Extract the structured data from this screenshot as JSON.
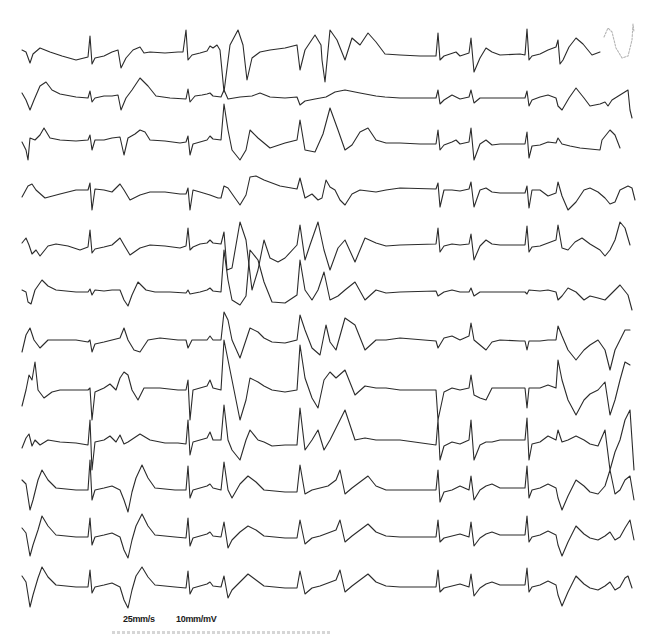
{
  "calibration": {
    "paper_speed": "25mm/s",
    "gain": "10mm/mV"
  },
  "footer_text": "",
  "colors": {
    "trace": "#2b2b2b",
    "faded_trace": "#b5b5b5",
    "background": "#ffffff"
  },
  "leads": [
    {
      "index": 1,
      "baseline_y": 57,
      "d": "M22,50 L26,52 L30,63 L33,54 L40,48 L50,52 L62,56 L76,60 L88,57 L90,36 L92,64 L95,58 L104,56 L112,52 L118,50 L121,68 L126,58 L133,50 L140,47 L144,53 L150,52 L165,53 L178,52 L183,52 L186,30 L188,60 L192,55 L200,53 L207,51 L210,46 L213,48 L217,45 L220,50 L224,92 L230,45 L238,30 L243,45 L247,80 L252,58 L260,52 L270,50 L285,48 L297,45 L300,70 L305,50 L315,35 L321,45 L322,60 L325,82 L330,30 L337,40 L345,60 L352,38 L360,45 L368,33 L376,42 L385,54 L400,55 L420,56 L436,56 L438,33 L440,60 L444,56 L456,52 L460,56 L469,53 L471,38 L474,72 L480,58 L486,48 L492,52 L500,55 L520,54 L525,55 L527,29 L529,60 L532,56 L540,54 L548,50 L556,47 L558,40 L560,64 L563,60 L569,47 L576,38 L583,44 L592,55 L600,52"
    },
    {
      "index": 2,
      "baseline_y": 98,
      "d": "M22,93 L26,100 L30,110 L34,100 L40,86 L46,82 L52,90 L60,94 L76,97 L88,98 L90,91 L92,102 L95,98 L104,96 L112,96 L118,95 L121,110 L126,98 L132,90 L140,78 L148,86 L156,96 L170,98 L186,99 L188,89 L190,102 L195,96 L202,95 L207,94 L210,93 L213,96 L221,97 L224,90 L228,99 L240,97 L252,96 L260,93 L270,97 L285,98 L297,97 L300,105 L305,101 L315,99 L326,97 L335,92 L345,90 L360,93 L376,96 L385,97 L400,98 L420,98 L436,98 L438,90 L440,104 L444,100 L452,95 L460,99 L469,97 L471,90 L474,103 L480,98 L492,98 L500,98 L520,98 L525,98 L527,91 L529,106 L532,100 L540,97 L548,95 L556,98 L558,106 L562,110 L569,98 L576,88 L584,98 L590,106 L600,104 L605,102 L608,106 L612,100 L620,95 L628,90 L630,110 L632,118"
    },
    {
      "index": 3,
      "baseline_y": 141,
      "d": "M22,142 L26,150 L28,160 L30,138 L35,140 L40,135 L44,128 L50,138 L60,140 L76,141 L88,140 L90,135 L92,150 L95,140 L104,140 L112,138 L120,137 L124,155 L128,138 L135,134 L140,130 L145,132 L150,140 L165,141 L180,143 L186,142 L188,136 L190,155 L193,144 L200,142 L207,140 L210,136 L213,139 L221,140 L224,104 L228,130 L232,150 L240,160 L246,150 L250,130 L258,138 L270,148 L285,143 L297,140 L300,120 L305,150 L315,152 L323,134 L330,108 L338,130 L345,150 L352,145 L360,132 L368,128 L376,140 L386,143 L400,143 L420,144 L436,144 L438,130 L440,150 L444,145 L452,142 L456,140 L460,144 L469,142 L471,128 L474,160 L480,144 L486,140 L492,145 L500,144 L520,144 L525,144 L527,132 L529,158 L532,146 L540,145 L548,142 L556,143 L558,138 L562,144 L570,146 L580,148 L600,150 L602,140 L606,135 L610,130 L615,135 L620,148"
    },
    {
      "index": 4,
      "baseline_y": 187,
      "d": "M22,197 L28,186 L32,184 L36,190 L45,198 L60,194 L76,190 L88,190 L90,183 L92,210 L95,189 L104,190 L112,192 L120,184 L124,190 L130,200 L140,195 L150,192 L165,192 L180,194 L186,194 L188,188 L190,210 L193,190 L200,192 L210,195 L218,198 L221,198 L224,186 L228,188 L235,198 L240,205 L246,195 L250,177 L256,176 L264,180 L280,186 L297,189 L300,178 L305,198 L312,194 L318,200 L322,198 L326,180 L330,187 L335,190 L340,200 L345,205 L352,194 L360,190 L376,192 L386,190 L400,188 L436,189 L438,183 L440,207 L444,190 L452,190 L460,191 L469,189 L471,182 L474,207 L480,190 L486,188 L492,192 L500,193 L520,193 L525,193 L527,186 L529,208 L532,190 L540,190 L548,196 L556,193 L558,182 L562,196 L568,210 L576,202 L584,190 L590,188 L598,192 L605,198 L610,204 L615,202 L620,190 L628,186 L632,188 L635,200"
    },
    {
      "index": 5,
      "baseline_y": 243,
      "d": "M22,243 L26,238 L29,245 L32,254 L36,250 L40,256 L48,246 L56,244 L68,246 L80,250 L88,247 L90,230 L92,253 L95,249 L104,247 L112,245 L120,238 L124,245 L130,255 L140,248 L150,245 L165,246 L180,248 L186,246 L188,228 L190,250 L193,247 L200,244 L207,243 L210,240 L213,243 L221,244 L224,232 L227,270 L232,268 L240,222 L246,240 L252,290 L258,270 L264,240 L270,258 L278,262 L285,258 L297,245 L300,225 L305,260 L310,245 L318,222 L324,250 L330,270 L338,248 L345,240 L355,262 L365,238 L376,243 L386,246 L400,245 L436,244 L438,228 L440,252 L444,246 L452,244 L460,245 L469,244 L471,234 L474,260 L480,246 L486,240 L492,244 L500,245 L520,245 L525,245 L527,226 L529,252 L532,247 L540,246 L548,243 L556,240 L558,225 L562,248 L568,250 L575,242 L582,238 L590,244 L600,250 L605,256 L610,250 L615,240 L620,222 L625,228 L630,245"
    },
    {
      "index": 6,
      "baseline_y": 291,
      "d": "M22,290 L26,292 L28,302 L31,304 L35,290 L42,280 L48,286 L56,290 L76,292 L88,292 L90,289 L92,295 L95,290 L104,291 L112,290 L120,290 L124,300 L128,306 L132,295 L138,282 L146,290 L155,292 L170,292 L186,293 L188,290 L190,294 L200,292 L207,290 L210,288 L213,291 L221,292 L224,250 L228,280 L232,300 L240,305 L246,296 L250,250 L258,260 L264,282 L272,302 L285,303 L297,295 L300,260 L305,290 L312,300 L318,290 L324,272 L330,300 L338,296 L345,290 L355,282 L365,300 L376,290 L386,293 L400,292 L436,291 L438,296 L444,292 L452,290 L460,292 L469,292 L471,288 L474,296 L480,292 L492,292 L500,292 L520,292 L525,292 L527,294 L529,290 L540,291 L548,290 L556,292 L558,300 L562,296 L568,288 L576,292 L584,300 L590,296 L598,298 L605,300 L610,295 L615,290 L620,285 L628,295 L632,310"
    },
    {
      "index": 7,
      "baseline_y": 340,
      "d": "M22,352 L26,335 L30,328 L34,340 L40,348 L48,340 L60,340 L76,340 L88,342 L90,340 L92,352 L95,344 L104,342 L112,340 L120,338 L124,328 L128,340 L134,350 L140,352 L148,340 L160,338 L178,340 L186,340 L188,348 L192,340 L200,340 L207,340 L210,336 L213,340 L221,340 L224,312 L228,320 L232,340 L240,358 L246,340 L250,328 L258,332 L264,338 L272,342 L285,343 L297,340 L300,315 L305,330 L312,348 L320,355 L326,325 L330,342 L336,350 L345,318 L355,325 L365,350 L376,340 L386,340 L400,338 L436,341 L438,348 L444,338 L452,336 L460,340 L469,336 L471,323 L474,340 L480,345 L486,350 L492,342 L500,340 L520,341 L525,341 L527,350 L529,341 L540,341 L548,340 L556,340 L558,326 L562,336 L568,350 L576,360 L584,350 L590,345 L598,340 L605,350 L610,370 L615,350 L620,340 L625,330 L630,330"
    },
    {
      "index": 8,
      "baseline_y": 390,
      "d": "M22,406 L26,390 L29,375 L32,380 L35,362 L38,390 L44,398 L52,392 L60,390 L76,390 L88,390 L90,388 L92,420 L95,392 L104,388 L110,384 L116,390 L120,378 L124,372 L128,375 L132,390 L138,400 L144,388 L160,388 L178,390 L186,390 L188,380 L190,420 L193,390 L200,388 L207,386 L210,380 L213,388 L221,390 L224,340 L228,360 L232,380 L240,420 L246,400 L250,378 L258,382 L264,386 L272,390 L285,392 L297,390 L300,345 L305,378 L312,398 L318,408 L324,380 L330,372 L336,378 L345,370 L355,395 L365,386 L376,388 L386,388 L400,390 L436,390 L438,420 L444,392 L452,388 L460,390 L469,388 L471,375 L474,395 L480,398 L486,400 L492,388 L500,388 L520,388 L525,388 L527,408 L529,388 L540,388 L548,385 L556,388 L558,360 L562,380 L568,400 L576,415 L584,400 L590,394 L598,390 L605,382 L610,415 L615,400 L620,380 L625,362 L630,365"
    },
    {
      "index": 9,
      "baseline_y": 441,
      "d": "M22,448 L26,438 L29,434 L32,446 L35,440 L40,445 L48,440 L60,442 L76,443 L88,445 L90,420 L92,470 L95,442 L104,440 L110,436 L116,442 L120,435 L124,444 L128,442 L140,434 L150,440 L165,443 L178,443 L186,444 L188,420 L190,455 L193,442 L200,440 L207,438 L210,432 L213,440 L221,440 L224,405 L228,440 L232,450 L240,460 L246,440 L250,430 L258,440 L264,442 L272,446 L285,445 L297,445 L300,408 L305,450 L312,440 L318,430 L324,450 L330,440 L336,428 L345,410 L355,440 L365,438 L376,440 L386,440 L400,440 L436,445 L438,420 L440,460 L444,446 L452,442 L460,444 L469,440 L471,420 L474,460 L480,445 L486,442 L492,442 L500,440 L520,440 L525,440 L527,418 L529,460 L532,444 L540,442 L548,436 L556,440 L558,430 L562,442 L568,440 L576,436 L584,440 L590,444 L598,446 L605,430 L610,470 L615,452 L620,440 L625,420 L630,410 L634,470"
    },
    {
      "index": 10,
      "baseline_y": 490,
      "d": "M22,480 L26,484 L30,510 L33,500 L38,480 L42,470 L48,480 L56,488 L76,490 L88,490 L90,460 L92,500 L95,490 L104,488 L112,486 L120,490 L124,500 L128,512 L132,492 L136,478 L142,465 L148,478 L155,488 L175,490 L186,490 L188,466 L190,498 L193,490 L200,488 L207,486 L210,484 L213,488 L221,490 L224,462 L228,490 L232,498 L240,484 L248,476 L256,482 L264,490 L285,492 L297,492 L300,465 L305,494 L312,490 L320,488 L328,486 L336,480 L340,470 L345,494 L352,488 L360,482 L368,476 L376,486 L386,490 L400,490 L436,490 L438,470 L440,502 L444,492 L452,490 L460,486 L469,490 L471,476 L474,500 L480,490 L486,486 L492,484 L500,488 L520,488 L525,488 L527,466 L529,498 L532,490 L540,488 L548,484 L556,488 L558,498 L562,510 L568,496 L576,480 L584,486 L590,492 L598,494 L605,486 L610,470 L615,494 L620,490 L625,480 L630,476 L634,500"
    },
    {
      "index": 11,
      "baseline_y": 537,
      "d": "M22,528 L26,533 L30,556 L33,545 L38,530 L42,516 L48,526 L56,535 L76,537 L88,537 L90,518 L92,545 L95,537 L104,535 L112,533 L120,537 L124,550 L128,558 L132,540 L136,526 L142,514 L148,526 L155,535 L175,537 L186,538 L188,518 L190,546 L193,538 L200,536 L207,534 L210,532 L213,536 L221,537 L224,522 L228,548 L232,540 L240,532 L248,526 L256,530 L264,536 L285,538 L297,538 L300,520 L305,544 L312,538 L320,536 L328,533 L336,530 L340,520 L345,542 L352,536 L360,530 L368,524 L376,532 L386,536 L400,537 L436,537 L438,520 L440,542 L444,538 L452,536 L460,534 L469,537 L471,522 L474,546 L480,538 L486,534 L492,532 L500,535 L520,535 L525,535 L527,516 L529,542 L532,537 L540,535 L548,531 L556,535 L558,545 L562,556 L568,542 L576,526 L584,534 L590,538 L598,540 L605,536 L610,532 L615,540 L620,537 L625,528 L630,520 L634,540"
    },
    {
      "index": 12,
      "baseline_y": 587,
      "d": "M22,576 L26,582 L30,607 L33,595 L38,578 L42,567 L48,577 L56,585 L76,587 L88,587 L90,570 L92,593 L95,587 L104,585 L112,583 L120,587 L124,600 L128,608 L132,590 L136,576 L142,567 L148,577 L155,585 L175,587 L186,588 L188,571 L190,594 L193,588 L200,586 L207,584 L210,582 L213,586 L221,587 L224,576 L228,598 L232,590 L240,582 L248,574 L256,580 L264,586 L285,588 L297,588 L300,571 L305,594 L312,588 L320,586 L328,583 L336,580 L340,570 L345,592 L352,586 L360,580 L368,574 L376,582 L386,586 L400,587 L436,587 L438,570 L440,592 L444,588 L452,586 L460,584 L469,587 L471,574 L474,596 L480,588 L486,584 L492,582 L500,585 L520,585 L525,585 L527,568 L529,592 L532,587 L540,585 L548,581 L556,585 L558,595 L562,606 L568,592 L576,576 L584,584 L590,588 L598,590 L605,586 L610,582 L615,590 L620,587 L625,578 L628,576 L632,588"
    }
  ],
  "artifacts": [
    {
      "name": "faded-trace-segment",
      "d": "M604,37 L608,28 L612,32 L616,48 L622,58 L628,56 L632,40 L633,24 L634,32"
    }
  ]
}
